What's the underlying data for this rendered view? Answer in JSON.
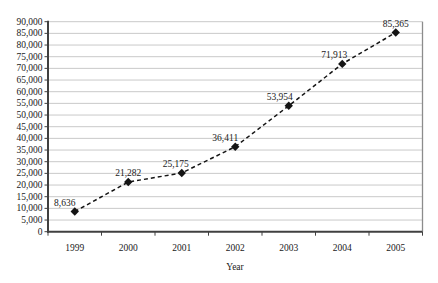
{
  "chart_data": {
    "type": "line",
    "title": "",
    "xlabel": "Year",
    "ylabel": "",
    "categories": [
      "1999",
      "2000",
      "2001",
      "2002",
      "2003",
      "2004",
      "2005"
    ],
    "values": [
      8636,
      21282,
      25175,
      36411,
      53954,
      71913,
      85365
    ],
    "point_labels": [
      "8,636",
      "21,282",
      "25,175",
      "36,411",
      "53,954",
      "71,913",
      "85,365"
    ],
    "ylim": [
      0,
      90000
    ],
    "ytick_step": 5000,
    "ytick_labels": [
      "0",
      "5,000",
      "10,000",
      "15,000",
      "20,000",
      "25,000",
      "30,000",
      "35,000",
      "40,000",
      "45,000",
      "50,000",
      "55,000",
      "60,000",
      "65,000",
      "70,000",
      "75,000",
      "80,000",
      "85,000",
      "90,000"
    ],
    "grid": true,
    "legend": "none",
    "line_style": "dashed",
    "marker": "diamond",
    "label_dx": [
      -10,
      0,
      -6,
      -10,
      -9,
      -8,
      0
    ],
    "colors": {
      "line": "#141414",
      "marker": "#141414",
      "grid": "#c9c9c9",
      "axis": "#404040",
      "right_border": "#8c8c8c",
      "text": "#1a1a1a",
      "background": "#ffffff"
    }
  }
}
